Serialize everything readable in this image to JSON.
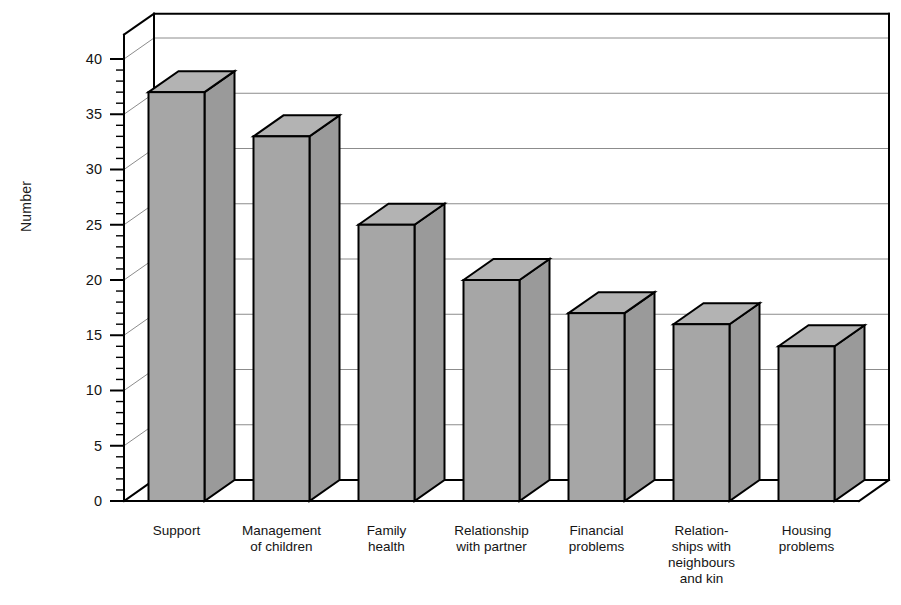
{
  "chart_data": {
    "type": "bar",
    "title": "",
    "subtitle": "",
    "xlabel": "",
    "ylabel": "Number",
    "ylim": [
      0,
      40
    ],
    "ytick_step": 5,
    "yminor_step": 1,
    "grid": "horizontal",
    "legend": "none",
    "style": "3d-column",
    "categories": [
      "Support",
      "Management\nof children",
      "Family\nhealth",
      "Relationship\nwith partner",
      "Financial\nproblems",
      "Relation-\nships with\nneighbours\nand kin",
      "Housing\nproblems"
    ],
    "values": [
      37,
      33,
      25,
      20,
      17,
      16,
      14
    ],
    "ytick_labels": [
      "0",
      "5",
      "10",
      "15",
      "20",
      "25",
      "30",
      "35",
      "40"
    ],
    "ytick_values": [
      0,
      5,
      10,
      15,
      20,
      25,
      30,
      35,
      40
    ],
    "colors": {
      "bar_front": "#a6a6a6",
      "bar_top": "#b3b3b3",
      "bar_side": "#9a9a9a",
      "bar_outline": "#000000",
      "grid": "#8c8c8c",
      "axis": "#000000",
      "background": "#ffffff",
      "text": "#141414"
    }
  },
  "axis": {
    "y_title": "Number"
  }
}
